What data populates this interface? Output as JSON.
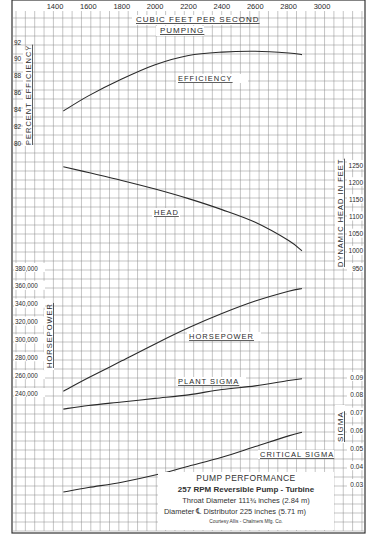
{
  "chart_data": {
    "type": "line",
    "title": "Pump Performance",
    "subtitle_lines": [
      "257 RPM Reversible Pump - Turbine",
      "Throat Diameter 111 3/4 inches (2.84 m)",
      "Diameter ℄ Distributor 225 inches (5.71 m)",
      "Courtesy  Allis - Chalmers Mfg. Co."
    ],
    "xlabel": "Cubic Feet Per Second",
    "xlabel2": "Pumping",
    "x_ticks": [
      1400,
      1600,
      1800,
      2000,
      2200,
      2400,
      2600,
      2800,
      3000
    ],
    "xlim": [
      1400,
      3000
    ],
    "grid": true,
    "axes": [
      {
        "name": "efficiency",
        "label": "Percent Efficiency",
        "side": "left",
        "ticks": [
          80,
          82,
          84,
          86,
          88,
          90,
          92
        ],
        "range": [
          80,
          92
        ]
      },
      {
        "name": "head",
        "label": "Dynamic Head in Feet",
        "side": "right",
        "ticks": [
          950,
          1000,
          1050,
          1100,
          1150,
          1200,
          1250
        ],
        "range": [
          950,
          1250
        ]
      },
      {
        "name": "horsepower",
        "label": "Horsepower",
        "side": "left",
        "ticks": [
          "240,000",
          "260,000",
          "280,000",
          "300,000",
          "320,000",
          "340,000",
          "360,000",
          "380,000"
        ],
        "range": [
          240000,
          380000
        ]
      },
      {
        "name": "sigma",
        "label": "Sigma",
        "side": "right",
        "ticks": [
          "0.03",
          "0.04",
          "0.05",
          "0.06",
          "0.07",
          "0.08",
          "0.09"
        ],
        "range": [
          0.03,
          0.09
        ]
      }
    ],
    "x": [
      1450,
      1600,
      1800,
      2000,
      2200,
      2400,
      2600,
      2800,
      2880
    ],
    "series": [
      {
        "name": "Efficiency",
        "axis": "efficiency",
        "values": [
          83.8,
          85.6,
          87.6,
          89.3,
          90.4,
          90.8,
          90.9,
          90.7,
          90.5
        ]
      },
      {
        "name": "Head",
        "axis": "head",
        "values": [
          1245,
          1228,
          1205,
          1180,
          1152,
          1120,
          1083,
          1030,
          1000
        ]
      },
      {
        "name": "Horsepower",
        "axis": "horsepower",
        "values": [
          242000,
          257000,
          276000,
          295000,
          313000,
          329000,
          343000,
          354000,
          357000
        ]
      },
      {
        "name": "Plant Sigma",
        "axis": "sigma",
        "values": [
          0.072,
          0.074,
          0.076,
          0.078,
          0.08,
          0.083,
          0.085,
          0.088,
          0.089
        ]
      },
      {
        "name": "Critical Sigma",
        "axis": "sigma",
        "values": [
          0.0255,
          0.028,
          0.031,
          0.035,
          0.04,
          0.045,
          0.051,
          0.057,
          0.059
        ]
      }
    ],
    "annotations": [
      "Efficiency",
      "Head",
      "Horsepower",
      "Plant Sigma",
      "Critical Sigma"
    ]
  },
  "labels": {
    "xlabel": "CUBIC FEET PER SECOND",
    "xlabel2": "PUMPING",
    "eff_axis": "PERCENT EFFICIENCY",
    "head_axis": "DYNAMIC HEAD IN FEET",
    "hp_axis": "HORSEPOWER",
    "sigma_axis": "SIGMA",
    "efficiency": "EFFICIENCY",
    "head": "HEAD",
    "horsepower": "HORSEPOWER",
    "plant_sigma": "PLANT SIGMA",
    "critical_sigma": "CRITICAL SIGMA"
  },
  "caption": {
    "title": "PUMP PERFORMANCE",
    "line1": "257 RPM  Reversible  Pump - Turbine",
    "line2": "Throat Diameter 111¾ inches (2.84 m)",
    "line3": "Diameter ℄ Distributor 225 inches (5.71 m)",
    "courtesy": "Courtesy   Allis - Chalmers Mfg. Co."
  },
  "colors": {
    "grid": "#8a8a8a",
    "curve": "#2a2a2a",
    "background": "#ffffff"
  }
}
